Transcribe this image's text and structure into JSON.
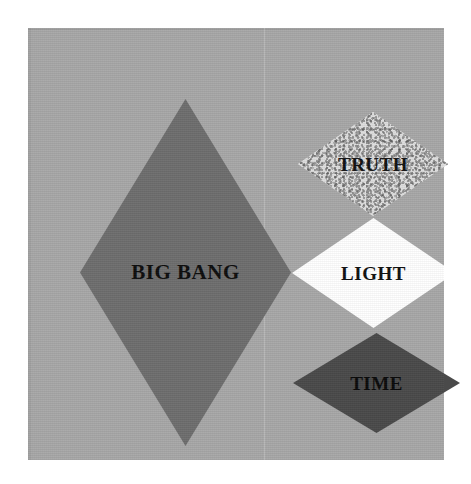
{
  "artwork": {
    "title": "Big Bang diagram with Truth, Light and Time diamonds",
    "background_color": "#ffffff",
    "panel_color": "#a8a8a8",
    "text_color": "#111111"
  },
  "shapes": [
    {
      "id": "bigbang",
      "label": "BIG BANG",
      "shape": "diamond",
      "fill": "#6e6e6e",
      "fill_name": "medium gray",
      "texture": "solid",
      "position": "left",
      "size": "large-tall"
    },
    {
      "id": "truth",
      "label": "TRUTH",
      "shape": "diamond",
      "fill": "#dedede",
      "fill_name": "speckled light gray granite",
      "texture": "mottled-speckle",
      "position": "top-right",
      "size": "small-wide"
    },
    {
      "id": "light",
      "label": "LIGHT",
      "shape": "diamond",
      "fill": "#ffffff",
      "fill_name": "white",
      "texture": "solid",
      "position": "middle-right",
      "size": "small-wide"
    },
    {
      "id": "time",
      "label": "TIME",
      "shape": "diamond",
      "fill": "#4a4a4a",
      "fill_name": "dark charcoal gray",
      "texture": "solid",
      "position": "bottom-right",
      "size": "small-wide"
    }
  ]
}
